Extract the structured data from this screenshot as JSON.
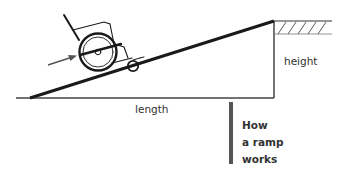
{
  "diagram": {
    "labels": {
      "length": "length",
      "height": "height"
    },
    "caption": {
      "lines": [
        "How",
        "a ramp",
        "works"
      ]
    },
    "elements": {
      "ramp": "inclined-plane",
      "wheelchair": "wheelchair-on-ramp",
      "force_arrow": "push-arrow",
      "ground": "hatched-raised-ground"
    },
    "colors": {
      "line": "#222222",
      "arrow": "#555555",
      "caption_bar": "#555555",
      "text": "#333333"
    }
  }
}
